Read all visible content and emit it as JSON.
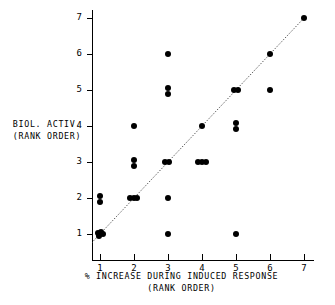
{
  "chart_data": {
    "type": "scatter",
    "title": "",
    "xlabel": "% INCREASE DURING INDUCED RESPONSE",
    "xlabel_sub": "(RANK ORDER)",
    "ylabel": "BIOL. ACTIV.",
    "ylabel_sub": "(RANK ORDER)",
    "xlim": [
      1,
      7
    ],
    "ylim": [
      1,
      7
    ],
    "xticks": [
      "1",
      "2",
      "3",
      "4",
      "5",
      "6",
      "7"
    ],
    "yticks": [
      "1",
      "2",
      "3",
      "4",
      "5",
      "6",
      "7"
    ],
    "grid": false,
    "legend": null,
    "marker_color": "#000000",
    "reference_line": {
      "type": "identity",
      "style": "dotted",
      "from": [
        0.75,
        0.75
      ],
      "to": [
        7,
        7
      ],
      "color": "#555555"
    },
    "points": [
      {
        "x": 1,
        "y": 2.05
      },
      {
        "x": 1,
        "y": 1.88
      },
      {
        "x": 0.93,
        "y": 1.02
      },
      {
        "x": 1.02,
        "y": 1.06
      },
      {
        "x": 1.1,
        "y": 1.0
      },
      {
        "x": 0.98,
        "y": 0.94
      },
      {
        "x": 2,
        "y": 4.0
      },
      {
        "x": 2,
        "y": 3.05
      },
      {
        "x": 2,
        "y": 2.88
      },
      {
        "x": 1.88,
        "y": 2.0
      },
      {
        "x": 1.99,
        "y": 2.0
      },
      {
        "x": 2.1,
        "y": 2.0
      },
      {
        "x": 3,
        "y": 6.0
      },
      {
        "x": 3,
        "y": 5.05
      },
      {
        "x": 3,
        "y": 4.88
      },
      {
        "x": 2.92,
        "y": 3.0
      },
      {
        "x": 3.04,
        "y": 3.0
      },
      {
        "x": 3,
        "y": 2.0
      },
      {
        "x": 3,
        "y": 1.0
      },
      {
        "x": 4,
        "y": 4.0
      },
      {
        "x": 3.88,
        "y": 3.0
      },
      {
        "x": 4.0,
        "y": 3.0
      },
      {
        "x": 4.12,
        "y": 3.0
      },
      {
        "x": 4.93,
        "y": 5.0
      },
      {
        "x": 5.05,
        "y": 5.0
      },
      {
        "x": 5,
        "y": 4.08
      },
      {
        "x": 5,
        "y": 3.92
      },
      {
        "x": 5,
        "y": 1.0
      },
      {
        "x": 6,
        "y": 6.0
      },
      {
        "x": 6,
        "y": 5.0
      },
      {
        "x": 7,
        "y": 7.0
      }
    ]
  }
}
